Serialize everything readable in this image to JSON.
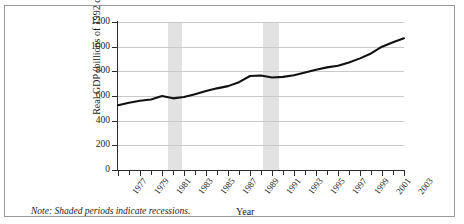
{
  "figure": {
    "note": "Note: Shaded periods indicate recessions."
  },
  "chart_data": {
    "type": "line",
    "title": "",
    "xlabel": "Year",
    "ylabel": "Real GDP (billions of 1992 dollars)",
    "xlim": [
      1977,
      2003
    ],
    "ylim": [
      0,
      1200
    ],
    "grid": true,
    "legend": "none",
    "ytick_labels": [
      "1200",
      "1000",
      "800",
      "600",
      "400",
      "200",
      "0"
    ],
    "ytick_values": [
      1200,
      1000,
      800,
      600,
      400,
      200,
      0
    ],
    "xtick_labels": [
      "1977",
      "1979",
      "1981",
      "1983",
      "1985",
      "1987",
      "1989",
      "1991",
      "1993",
      "1995",
      "1997",
      "1999",
      "2001",
      "2003"
    ],
    "xtick_values": [
      1977,
      1979,
      1981,
      1983,
      1985,
      1987,
      1989,
      1991,
      1993,
      1995,
      1997,
      1999,
      2001,
      2003
    ],
    "x": [
      1977,
      1978,
      1979,
      1980,
      1981,
      1982,
      1983,
      1984,
      1985,
      1986,
      1987,
      1988,
      1989,
      1990,
      1991,
      1992,
      1993,
      1994,
      1995,
      1996,
      1997,
      1998,
      1999,
      2000,
      2001,
      2002,
      2003
    ],
    "values": [
      525,
      545,
      562,
      572,
      600,
      581,
      592,
      615,
      640,
      662,
      680,
      712,
      762,
      766,
      750,
      755,
      768,
      790,
      812,
      832,
      845,
      872,
      905,
      945,
      1000,
      1035,
      1068
    ],
    "series": [
      {
        "name": "Real GDP",
        "color": "#111111",
        "values": [
          525,
          545,
          562,
          572,
          600,
          581,
          592,
          615,
          640,
          662,
          680,
          712,
          762,
          766,
          750,
          755,
          768,
          790,
          812,
          832,
          845,
          872,
          905,
          945,
          1000,
          1035,
          1068
        ]
      }
    ],
    "shaded_regions": [
      {
        "label": "recession",
        "start": 1981.5,
        "end": 1982.8,
        "color": "#e2e2e2"
      },
      {
        "label": "recession",
        "start": 1990.2,
        "end": 1991.6,
        "color": "#e2e2e2"
      }
    ]
  }
}
